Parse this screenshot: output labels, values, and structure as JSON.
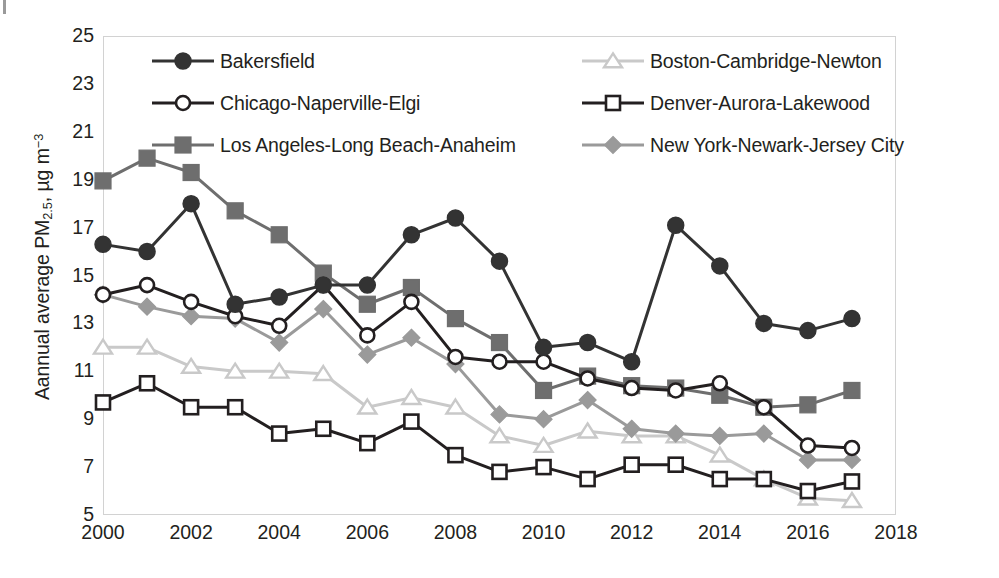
{
  "chart_data": {
    "type": "line",
    "title": "",
    "xlabel": "",
    "ylabel": "Aannual average PM2.5, µg m-3",
    "ylabel_parts": {
      "prefix": "Aannual average PM",
      "sub": "2.5",
      "mid": ", µg m",
      "sup": "−3"
    },
    "x": [
      2000,
      2001,
      2002,
      2003,
      2004,
      2005,
      2006,
      2007,
      2008,
      2009,
      2010,
      2011,
      2012,
      2013,
      2014,
      2015,
      2016,
      2017
    ],
    "xlim": [
      2000,
      2018
    ],
    "ylim": [
      5,
      25
    ],
    "xticks": [
      "2000",
      "2002",
      "2004",
      "2006",
      "2008",
      "2010",
      "2012",
      "2014",
      "2016",
      "2018"
    ],
    "yticks": [
      "25",
      "23",
      "21",
      "19",
      "17",
      "15",
      "13",
      "11",
      "9",
      "7",
      "5"
    ],
    "grid": false,
    "legend_position": "top-inside",
    "series": [
      {
        "name": "Bakersfield",
        "color": "#333333",
        "marker": "circle-filled",
        "values": [
          16.3,
          16.0,
          18.0,
          13.8,
          14.1,
          14.6,
          14.6,
          16.7,
          17.4,
          15.6,
          12.0,
          12.2,
          11.4,
          17.1,
          15.4,
          13.0,
          12.7,
          13.2
        ]
      },
      {
        "name": "Chicago-Naperville-Elgi",
        "color": "#231f20",
        "marker": "circle-open",
        "values": [
          14.2,
          14.6,
          13.9,
          13.3,
          12.9,
          14.6,
          12.5,
          13.9,
          11.6,
          11.4,
          11.4,
          10.7,
          10.3,
          10.2,
          10.5,
          9.5,
          7.9,
          7.8
        ]
      },
      {
        "name": "Los Angeles-Long Beach-Anaheim",
        "color": "#6e6e6e",
        "marker": "square-filled",
        "values": [
          18.95,
          19.9,
          19.3,
          17.7,
          16.7,
          15.1,
          13.8,
          14.5,
          13.2,
          12.2,
          10.2,
          10.8,
          10.4,
          10.3,
          10.0,
          9.5,
          9.6,
          10.2
        ]
      },
      {
        "name": "Boston-Cambridge-Newton",
        "color": "#c9c9c9",
        "marker": "triangle-open",
        "values": [
          12.0,
          12.0,
          11.2,
          11.0,
          11.0,
          10.9,
          9.5,
          9.9,
          9.5,
          8.3,
          7.9,
          8.5,
          8.3,
          8.3,
          7.5,
          6.5,
          5.7,
          5.6
        ]
      },
      {
        "name": "Denver-Aurora-Lakewood",
        "color": "#231f20",
        "marker": "square-open",
        "values": [
          9.7,
          10.5,
          9.5,
          9.5,
          8.4,
          8.6,
          8.0,
          8.9,
          7.5,
          6.8,
          7.0,
          6.5,
          7.1,
          7.1,
          6.5,
          6.5,
          6.0,
          6.4
        ]
      },
      {
        "name": "New York-Newark-Jersey City",
        "color": "#9a9a9a",
        "marker": "diamond-filled",
        "values": [
          14.2,
          13.7,
          13.3,
          13.2,
          12.2,
          13.6,
          11.7,
          12.4,
          11.3,
          9.2,
          9.0,
          9.8,
          8.6,
          8.4,
          8.3,
          8.4,
          7.3,
          7.3
        ]
      }
    ]
  },
  "legend": {
    "items": [
      {
        "label": "Bakersfield"
      },
      {
        "label": "Boston-Cambridge-Newton"
      },
      {
        "label": "Chicago-Naperville-Elgi"
      },
      {
        "label": "Denver-Aurora-Lakewood"
      },
      {
        "label": "Los Angeles-Long Beach-Anaheim"
      },
      {
        "label": "New York-Newark-Jersey City"
      }
    ]
  },
  "page": {
    "corner_mark": "|"
  }
}
